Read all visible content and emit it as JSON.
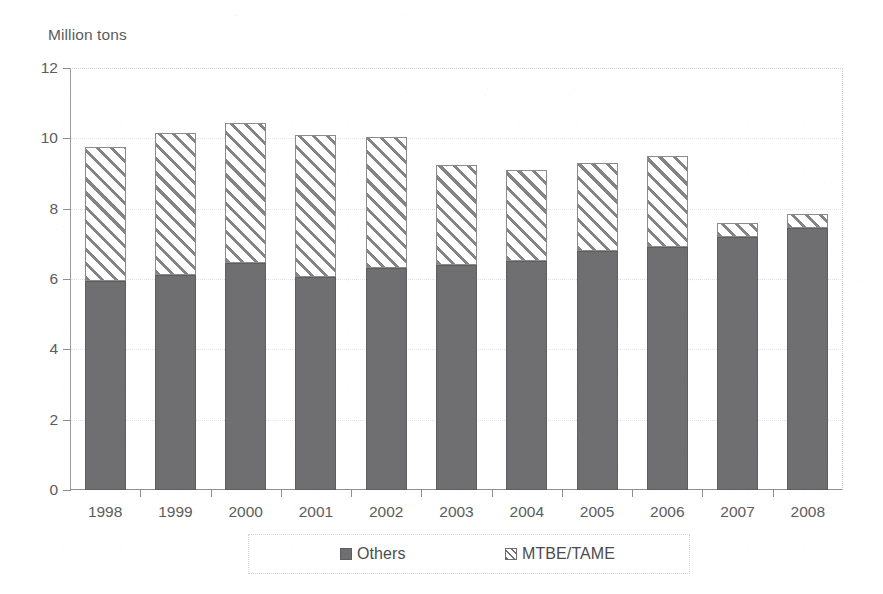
{
  "chart_data": {
    "type": "bar",
    "stacked": true,
    "title": "",
    "subtitle": "",
    "xlabel": "",
    "ylabel": "Million tons",
    "categories": [
      "1998",
      "1999",
      "2000",
      "2001",
      "2002",
      "2003",
      "2004",
      "2005",
      "2006",
      "2007",
      "2008"
    ],
    "series": [
      {
        "name": "Others",
        "fill": "solid-gray",
        "color": "#6f6f71",
        "values": [
          5.95,
          6.1,
          6.45,
          6.05,
          6.3,
          6.4,
          6.5,
          6.8,
          6.9,
          7.2,
          7.45
        ]
      },
      {
        "name": "MTBE/TAME",
        "fill": "diagonal-hatch",
        "color": "#ffffff",
        "values": [
          3.8,
          4.05,
          4.0,
          4.05,
          3.75,
          2.85,
          2.6,
          2.5,
          2.6,
          0.4,
          0.4
        ]
      }
    ],
    "totals": [
      9.75,
      10.15,
      10.45,
      10.1,
      10.05,
      9.25,
      9.1,
      9.3,
      9.5,
      7.6,
      7.85
    ],
    "ylim": [
      0,
      12
    ],
    "yticks": [
      0,
      2,
      4,
      6,
      8,
      10,
      12
    ],
    "ytick_labels": [
      "0",
      "2",
      "4",
      "6",
      "8",
      "10",
      "12"
    ],
    "grid": "horizontal-dotted",
    "legend_position": "bottom",
    "legend_entries": [
      "Others",
      "MTBE/TAME"
    ]
  },
  "legend": {
    "items": [
      {
        "label": "Others",
        "swatch": "solid-square-icon"
      },
      {
        "label": "MTBE/TAME",
        "swatch": "hatched-square-icon"
      }
    ]
  }
}
